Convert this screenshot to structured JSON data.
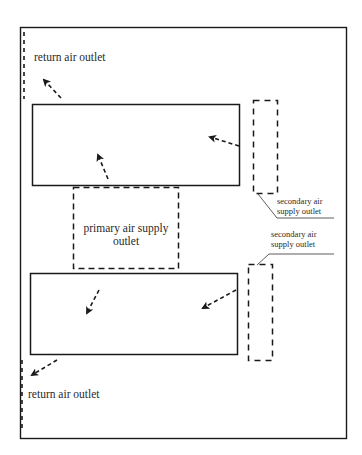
{
  "diagram": {
    "type": "air-distribution-layout",
    "colors": {
      "line": "#1a1a1a",
      "text": "#2a2a2a",
      "background": "#ffffff"
    },
    "labels": {
      "return_top": "return air outlet",
      "return_bottom": "return air outlet",
      "primary_line1": "primary air supply",
      "primary_line2": "outlet",
      "secondary_top_line1": "secondary air",
      "secondary_top_line2": "supply outlet",
      "secondary_bottom_line1": "secondary air",
      "secondary_bottom_line2": "supply outlet"
    },
    "elements": [
      {
        "id": "outer-frame",
        "style": "solid"
      },
      {
        "id": "upper-zone",
        "style": "solid"
      },
      {
        "id": "lower-zone",
        "style": "solid"
      },
      {
        "id": "primary-air-supply-outlet",
        "style": "dashed"
      },
      {
        "id": "secondary-air-supply-outlet-top",
        "style": "dashed"
      },
      {
        "id": "secondary-air-supply-outlet-bottom",
        "style": "dashed"
      },
      {
        "id": "return-air-outlet-top",
        "style": "dashed-line"
      },
      {
        "id": "return-air-outlet-bottom",
        "style": "dashed-line"
      }
    ],
    "arrows": [
      {
        "id": "arrow-to-return-top",
        "direction": "up-left"
      },
      {
        "id": "arrow-primary-to-upper",
        "direction": "up-left"
      },
      {
        "id": "arrow-secondary-to-upper",
        "direction": "left"
      },
      {
        "id": "arrow-primary-to-lower",
        "direction": "down-left"
      },
      {
        "id": "arrow-secondary-to-lower",
        "direction": "down-left"
      },
      {
        "id": "arrow-to-return-bottom",
        "direction": "down-left"
      }
    ]
  }
}
